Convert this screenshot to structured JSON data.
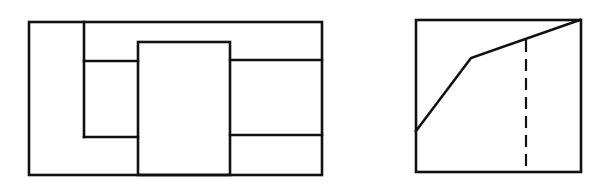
{
  "canvas": {
    "width": 605,
    "height": 191,
    "background": "#ffffff",
    "ink": "#111111"
  },
  "figures": [
    {
      "id": "left-figure",
      "description": "Rectangular frame divided into panels with a taller central block",
      "outer_rect": {
        "x": 29,
        "y": 22,
        "w": 293,
        "h": 153
      },
      "central_block": {
        "x": 138,
        "y": 42,
        "w": 92,
        "h": 133
      },
      "lines": [
        {
          "name": "left-inner-vertical",
          "x1": 84,
          "y1": 22,
          "x2": 84,
          "y2": 137
        },
        {
          "name": "left-upper-shelf",
          "x1": 84,
          "y1": 61,
          "x2": 138,
          "y2": 61
        },
        {
          "name": "left-lower-shelf",
          "x1": 84,
          "y1": 137,
          "x2": 138,
          "y2": 137
        },
        {
          "name": "right-upper-shelf",
          "x1": 230,
          "y1": 60,
          "x2": 322,
          "y2": 60
        },
        {
          "name": "right-lower-shelf",
          "x1": 230,
          "y1": 135,
          "x2": 322,
          "y2": 135
        }
      ]
    },
    {
      "id": "right-figure",
      "description": "Square frame with a bent polyline and a dashed vertical line",
      "outer_rect": {
        "x": 416,
        "y": 20,
        "w": 165,
        "h": 152
      },
      "polyline": "416,131 471,58 580,20",
      "dashed_line": {
        "x1": 526,
        "y1": 40,
        "x2": 526,
        "y2": 172
      }
    }
  ]
}
